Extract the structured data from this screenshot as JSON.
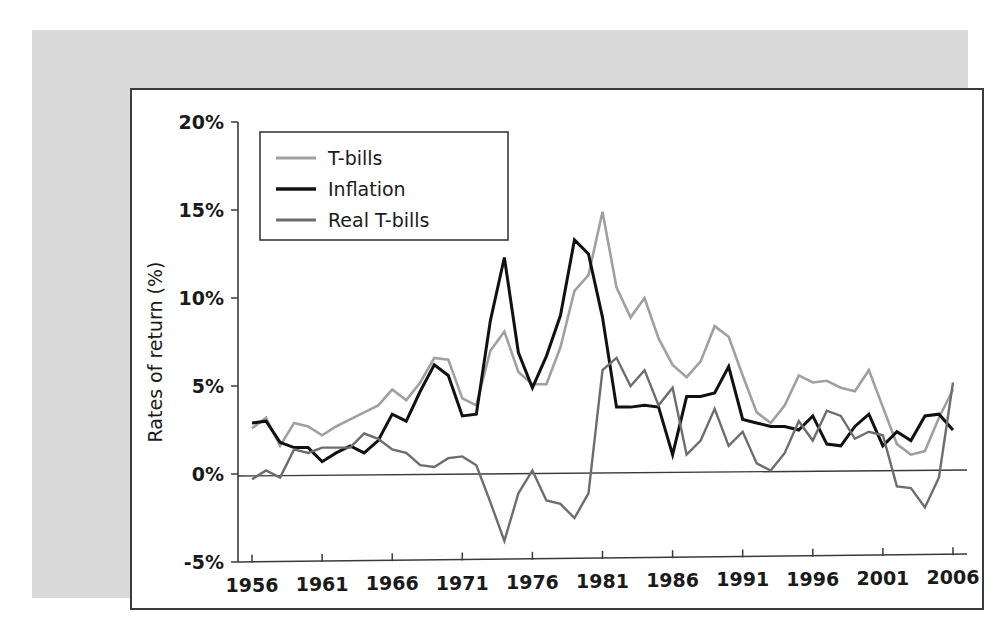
{
  "chart_data": {
    "type": "line",
    "title": "",
    "xlabel": "",
    "ylabel": "Rates of return (%)",
    "xlim": [
      1955,
      2007
    ],
    "ylim": [
      -5,
      20
    ],
    "ytick_labels": [
      "20%",
      "15%",
      "10%",
      "5%",
      "0%",
      "-5%"
    ],
    "ytick_values": [
      20,
      15,
      10,
      5,
      0,
      -5
    ],
    "xtick_labels": [
      "1956",
      "1961",
      "1966",
      "1971",
      "1976",
      "1981",
      "1986",
      "1991",
      "1996",
      "2001",
      "2006"
    ],
    "xtick_values": [
      1956,
      1961,
      1966,
      1971,
      1976,
      1981,
      1986,
      1991,
      1996,
      2001,
      2006
    ],
    "grid": false,
    "zero_line": true,
    "legend_position": "top-left",
    "x": [
      1956,
      1957,
      1958,
      1959,
      1960,
      1961,
      1962,
      1963,
      1964,
      1965,
      1966,
      1967,
      1968,
      1969,
      1970,
      1971,
      1972,
      1973,
      1974,
      1975,
      1976,
      1977,
      1978,
      1979,
      1980,
      1981,
      1982,
      1983,
      1984,
      1985,
      1986,
      1987,
      1988,
      1989,
      1990,
      1991,
      1992,
      1993,
      1994,
      1995,
      1996,
      1997,
      1998,
      1999,
      2000,
      2001,
      2002,
      2003,
      2004,
      2005,
      2006
    ],
    "series": [
      {
        "name": "T-bills",
        "color": "#a0a0a0",
        "values": [
          2.6,
          3.2,
          1.6,
          2.9,
          2.7,
          2.2,
          2.7,
          3.1,
          3.5,
          3.9,
          4.8,
          4.2,
          5.2,
          6.6,
          6.5,
          4.3,
          3.9,
          7.0,
          8.1,
          5.8,
          5.1,
          5.1,
          7.2,
          10.4,
          11.3,
          14.9,
          10.6,
          8.9,
          10.0,
          7.7,
          6.2,
          5.5,
          6.4,
          8.4,
          7.8,
          5.6,
          3.5,
          2.9,
          3.9,
          5.6,
          5.2,
          5.3,
          4.9,
          4.7,
          5.9,
          3.8,
          1.7,
          1.1,
          1.3,
          3.2,
          4.8
        ]
      },
      {
        "name": "Inflation",
        "color": "#111111",
        "values": [
          2.9,
          3.0,
          1.8,
          1.5,
          1.5,
          0.7,
          1.2,
          1.6,
          1.2,
          1.9,
          3.4,
          3.0,
          4.7,
          6.2,
          5.6,
          3.3,
          3.4,
          8.7,
          12.3,
          6.9,
          4.9,
          6.7,
          9.0,
          13.3,
          12.5,
          8.9,
          3.8,
          3.8,
          3.9,
          3.8,
          1.1,
          4.4,
          4.4,
          4.6,
          6.1,
          3.1,
          2.9,
          2.7,
          2.7,
          2.5,
          3.3,
          1.7,
          1.6,
          2.7,
          3.4,
          1.6,
          2.4,
          1.9,
          3.3,
          3.4,
          2.5
        ]
      },
      {
        "name": "Real T-bills",
        "color": "#6d6d6d",
        "values": [
          -0.3,
          0.2,
          -0.2,
          1.4,
          1.2,
          1.5,
          1.5,
          1.5,
          2.3,
          2.0,
          1.4,
          1.2,
          0.5,
          0.4,
          0.9,
          1.0,
          0.5,
          -1.6,
          -3.8,
          -1.1,
          0.2,
          -1.5,
          -1.7,
          -2.5,
          -1.1,
          5.9,
          6.6,
          5.0,
          5.9,
          3.9,
          4.9,
          1.1,
          1.9,
          3.7,
          1.6,
          2.4,
          0.6,
          0.2,
          1.2,
          3.0,
          1.9,
          3.6,
          3.3,
          2.0,
          2.4,
          2.2,
          -0.7,
          -0.8,
          -1.9,
          -0.2,
          5.2
        ]
      }
    ]
  },
  "legend": {
    "entries": [
      {
        "label": "T-bills",
        "color": "#a0a0a0"
      },
      {
        "label": "Inflation",
        "color": "#111111"
      },
      {
        "label": "Real T-bills",
        "color": "#6d6d6d"
      }
    ]
  }
}
